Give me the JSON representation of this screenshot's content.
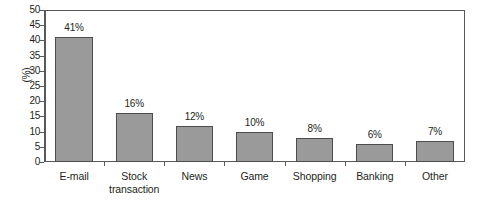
{
  "chart_data": {
    "type": "bar",
    "title": "",
    "subtitle": "",
    "xlabel": "",
    "ylabel": "(%)",
    "ylim": [
      0,
      50
    ],
    "ytick_step": 5,
    "yticks": [
      0,
      5,
      10,
      15,
      20,
      25,
      30,
      35,
      40,
      45,
      50
    ],
    "ytick_labels": [
      "0",
      "5",
      "10",
      "15",
      "20",
      "25",
      "30",
      "35",
      "40",
      "45",
      "50"
    ],
    "grid": false,
    "legend": false,
    "legend_position": "none",
    "categories": [
      "E-mail",
      "Stock\ntransaction",
      "News",
      "Game",
      "Shopping",
      "Banking",
      "Other"
    ],
    "values": [
      41,
      16,
      12,
      10,
      8,
      6,
      7
    ],
    "data_labels": [
      "41%",
      "16%",
      "12%",
      "10%",
      "8%",
      "6%",
      "7%"
    ],
    "bar_color": "#9a9a9a",
    "bar_edge_color": "#4d4d4d",
    "axis_color": "#58595b",
    "background_color": "#ffffff",
    "text_color": "#231f20"
  }
}
